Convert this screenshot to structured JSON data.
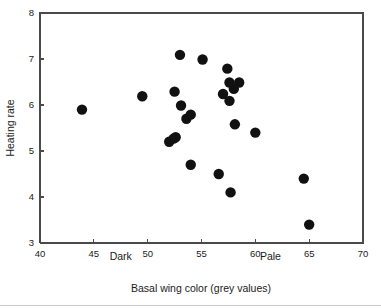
{
  "chart_data": {
    "type": "scatter",
    "title": "",
    "xlabel": "Basal wing color (grey values)",
    "ylabel": "Heating rate",
    "xlim": [
      40,
      70
    ],
    "ylim": [
      3,
      8
    ],
    "xticks": [
      40,
      45,
      50,
      55,
      60,
      65,
      70
    ],
    "yticks": [
      3,
      4,
      5,
      6,
      7,
      8
    ],
    "xtick_labels": [
      "40",
      "45",
      "50",
      "55",
      "60",
      "65",
      "70"
    ],
    "ytick_labels": [
      "3",
      "4",
      "5",
      "6",
      "7",
      "8"
    ],
    "grid": false,
    "legend": null,
    "marker_color": "#111111",
    "marker_size": 5.2,
    "annotations": [
      {
        "text": "Dark",
        "x": 47.5,
        "y": 2.62
      },
      {
        "text": "Pale",
        "x": 61.4,
        "y": 2.62
      }
    ],
    "series": [
      {
        "name": "Heating rate vs basal wing color",
        "points": [
          {
            "x": 43.9,
            "y": 5.9
          },
          {
            "x": 49.5,
            "y": 6.19
          },
          {
            "x": 52.0,
            "y": 5.2
          },
          {
            "x": 52.4,
            "y": 5.27
          },
          {
            "x": 52.6,
            "y": 5.3
          },
          {
            "x": 52.5,
            "y": 6.29
          },
          {
            "x": 53.0,
            "y": 7.09
          },
          {
            "x": 53.1,
            "y": 5.99
          },
          {
            "x": 53.6,
            "y": 5.7
          },
          {
            "x": 54.0,
            "y": 5.79
          },
          {
            "x": 54.0,
            "y": 4.7
          },
          {
            "x": 55.1,
            "y": 6.99
          },
          {
            "x": 56.6,
            "y": 4.5
          },
          {
            "x": 57.0,
            "y": 6.24
          },
          {
            "x": 57.4,
            "y": 6.79
          },
          {
            "x": 57.6,
            "y": 6.49
          },
          {
            "x": 57.6,
            "y": 6.09
          },
          {
            "x": 57.7,
            "y": 4.1
          },
          {
            "x": 58.0,
            "y": 6.35
          },
          {
            "x": 58.5,
            "y": 6.49
          },
          {
            "x": 58.1,
            "y": 5.58
          },
          {
            "x": 60.0,
            "y": 5.4
          },
          {
            "x": 64.5,
            "y": 4.4
          },
          {
            "x": 65.0,
            "y": 3.4
          }
        ]
      }
    ]
  },
  "plot": {
    "ylabel": "Heating rate",
    "xlabel": "Basal wing color (grey values)",
    "dark_label": "Dark",
    "pale_label": "Pale"
  }
}
